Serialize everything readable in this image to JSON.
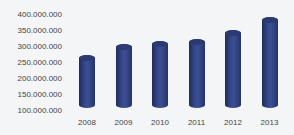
{
  "chart_data": {
    "type": "bar",
    "style": "3d-cylinder",
    "title": "",
    "xlabel": "",
    "ylabel": "",
    "categories": [
      "2008",
      "2009",
      "2010",
      "2011",
      "2012",
      "2013"
    ],
    "values": [
      265000000,
      300000000,
      310000000,
      315000000,
      345000000,
      385000000
    ],
    "ylim": [
      100000000,
      400000000
    ],
    "yticks": [
      "400.000.000",
      "350.000.000",
      "300.000.000",
      "250.000.000",
      "200.000.000",
      "150.000.000",
      "100.000.000"
    ],
    "grid": false,
    "legend": null,
    "bar_color": "#2e3d7a"
  }
}
